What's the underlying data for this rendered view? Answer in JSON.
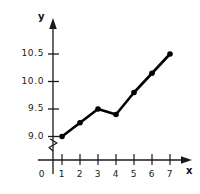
{
  "chart_data": {
    "type": "line",
    "title": "",
    "xlabel": "x",
    "ylabel": "y",
    "x": [
      1,
      2,
      3,
      4,
      5,
      6,
      7
    ],
    "values": [
      9.0,
      9.25,
      9.5,
      9.4,
      9.8,
      10.15,
      10.5
    ],
    "series": [
      {
        "name": "",
        "values": [
          9.0,
          9.25,
          9.5,
          9.4,
          9.8,
          10.15,
          10.5
        ]
      }
    ],
    "x_tick_labels": [
      "0",
      "1",
      "2",
      "3",
      "4",
      "5",
      "6",
      "7"
    ],
    "y_tick_labels": [
      "9.0",
      "9.5",
      "10.0",
      "10.5"
    ],
    "xlim": [
      0,
      7.8
    ],
    "ylim": [
      8.85,
      10.62
    ],
    "grid": false,
    "legend": "none",
    "y_axis_break": true,
    "marker": "filled-circle",
    "line_color": "#000000",
    "marker_color": "#000000",
    "axis_color": "#1a1a1a",
    "background_color": "#ffffff"
  },
  "axes": {
    "y_name": "y",
    "x_name": "x",
    "origin_label": "0"
  }
}
